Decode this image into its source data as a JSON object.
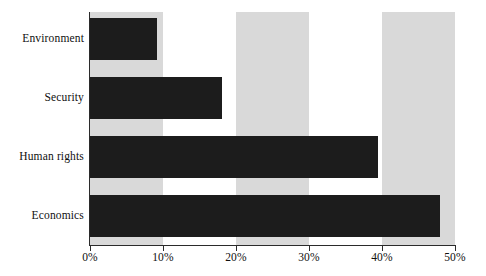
{
  "chart_data": {
    "type": "bar",
    "orientation": "horizontal",
    "title": "",
    "subtitle": "",
    "xlabel": "",
    "ylabel": "",
    "categories": [
      "Environment",
      "Security",
      "Human rights",
      "Economics"
    ],
    "values": [
      9.2,
      18.1,
      39.5,
      47.9
    ],
    "value_unit": "%",
    "xlim": [
      0,
      50
    ],
    "ylim": null,
    "xtick_values": [
      0,
      10,
      20,
      30,
      40,
      50
    ],
    "xtick_labels": [
      "0%",
      "10%",
      "20%",
      "30%",
      "40%",
      "50%"
    ],
    "grid": false,
    "legend": null,
    "legend_position": "none",
    "annotations": [],
    "banding": {
      "description": "alternating vertical shaded bands every 10%",
      "shaded_ranges": [
        [
          0,
          10
        ],
        [
          20,
          30
        ],
        [
          40,
          50
        ]
      ],
      "shade_color": "#d9d9d9",
      "unshaded_color": "#ffffff"
    },
    "colors": {
      "bar": "#1c1c1c",
      "band": "#d9d9d9",
      "axis": "#2b2b2b",
      "background": "#ffffff",
      "text": "#101010"
    }
  }
}
